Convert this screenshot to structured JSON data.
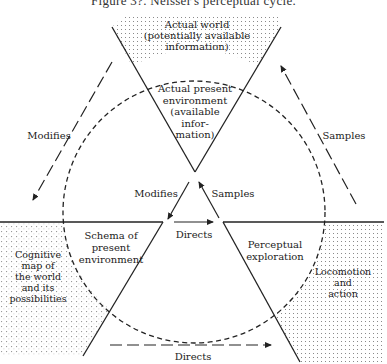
{
  "figure": {
    "title": "Figure 3?. Neisser's perceptual cycle.",
    "colors": {
      "line": "#222222",
      "stipple": "#9a9a9a",
      "background": "#ffffff"
    }
  },
  "nodes": {
    "actual_world": "Actual world\n(potentially available\ninformation)",
    "actual_present_environment": "Actual present\nenvironment\n(available\ninfor-\nmation)",
    "schema": "Schema of\npresent\nenvironment",
    "perceptual_exploration": "Perceptual\nexploration",
    "cognitive_map": "Cognitive\nmap of\nthe world\nand its\npossibilities",
    "locomotion": "Locomotion\nand\naction"
  },
  "arrows": {
    "outer_modifies": "Modifies",
    "outer_samples": "Samples",
    "inner_modifies": "Modifies",
    "inner_samples": "Samples",
    "inner_directs": "Directs",
    "outer_directs": "Directs"
  }
}
